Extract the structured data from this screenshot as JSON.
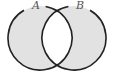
{
  "diagram": {
    "type": "venn",
    "sets": [
      {
        "name": "A",
        "label": "A",
        "cx": 40,
        "cy": 38,
        "r": 32
      },
      {
        "name": "B",
        "label": "B",
        "cx": 74,
        "cy": 38,
        "r": 32
      }
    ],
    "shaded_region": "A Δ B",
    "colors": {
      "fill": "#e2e2e2",
      "stroke": "#222222",
      "intersection": "#ffffff",
      "label": "#555555"
    }
  }
}
